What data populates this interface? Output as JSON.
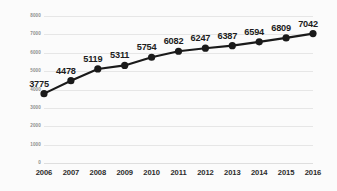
{
  "chart_data": {
    "type": "line",
    "title": "",
    "subtitle": "",
    "xlabel": "",
    "ylabel": "",
    "categories": [
      "2006",
      "2007",
      "2008",
      "2009",
      "2010",
      "2011",
      "2012",
      "2013",
      "2014",
      "2015",
      "2016"
    ],
    "values": [
      3775,
      4478,
      5119,
      5311,
      5754,
      6082,
      6247,
      6387,
      6594,
      6809,
      7042
    ],
    "point_labels": [
      "3775",
      "4478",
      "5119",
      "5311",
      "5754",
      "6082",
      "6247",
      "6387",
      "6594",
      "6809",
      "7042"
    ],
    "ylim": [
      0,
      8000
    ],
    "ytick_values": [
      0,
      1000,
      2000,
      3000,
      4000,
      5000,
      6000,
      7000,
      8000
    ],
    "ytick_labels": [
      "0",
      "1000",
      "2000",
      "3000",
      "4000",
      "5000",
      "6000",
      "7000",
      "8000"
    ],
    "grid": "horizontal",
    "legend": "none",
    "legend_position": "none",
    "series": [
      {
        "name": "",
        "values": [
          3775,
          4478,
          5119,
          5311,
          5754,
          6082,
          6247,
          6387,
          6594,
          6809,
          7042
        ]
      }
    ],
    "annotations": [],
    "colors": {
      "line": "#1a1a1a",
      "marker": "#1a1a1a",
      "gridline": "#e6e6e6",
      "background": "#fbfbfb",
      "data_label_text": "#1d1d1d",
      "x_tick_text": "#2b2b2b",
      "y_tick_text": "#8d8d8d"
    },
    "style": {
      "line_width_px": 2.1,
      "marker_shape": "circle",
      "marker_radius_px": 3.6,
      "data_labels_visible": true,
      "data_label_position": "above-left"
    }
  }
}
